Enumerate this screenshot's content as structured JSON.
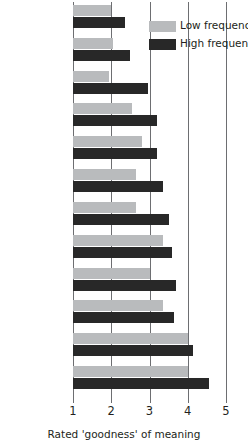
{
  "chart_data": {
    "type": "bar",
    "orientation": "horizontal",
    "title": "",
    "xlabel": "Rated 'goodness' of meaning",
    "ylabel": "",
    "xlim": [
      1,
      5
    ],
    "xticks": [
      1,
      2,
      3,
      4,
      5
    ],
    "xticklabels": [
      "1",
      "2",
      "3",
      "4",
      "5"
    ],
    "grid": "vertical",
    "legend_position": "top-right",
    "categories": [
      "Iktitaf",
      "Afworbu",
      "Saricik",
      "Biwojni",
      "Nansoma",
      "Kadirga",
      "Enanwal",
      "Dilikli",
      "Zabulon",
      "Lokanta",
      "Jandara",
      "Civadra"
    ],
    "series": [
      {
        "name": "Low frequency",
        "color": "#b9bbbd",
        "values": [
          2.0,
          2.05,
          1.95,
          2.55,
          2.8,
          2.65,
          2.65,
          3.35,
          3.0,
          3.35,
          4.0,
          4.0
        ]
      },
      {
        "name": "High frequency",
        "color": "#282828",
        "values": [
          2.35,
          2.5,
          2.95,
          3.2,
          3.2,
          3.35,
          3.5,
          3.6,
          3.7,
          3.65,
          4.15,
          4.55
        ]
      }
    ]
  },
  "legend": {
    "items": [
      {
        "label": "Low frequency"
      },
      {
        "label": "High frequency"
      }
    ]
  }
}
